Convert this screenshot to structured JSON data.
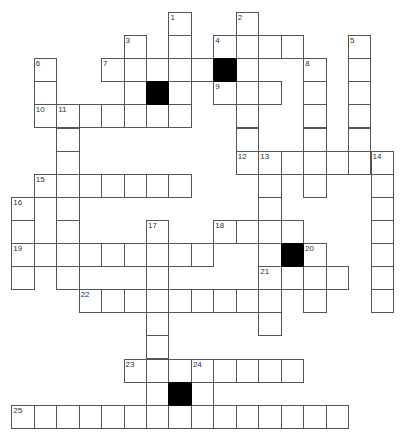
{
  "puzzle": {
    "type": "crossword",
    "grid": {
      "origin_x": 11.3,
      "origin_y": 12,
      "cell_w": 22.45,
      "cell_h": 23.1
    },
    "entries": [
      {
        "number": "1",
        "direction": "down",
        "row": 0,
        "col": 7,
        "length": 5
      },
      {
        "number": "2",
        "direction": "down",
        "row": 0,
        "col": 10,
        "length": 7
      },
      {
        "number": "3",
        "direction": "down",
        "row": 1,
        "col": 5,
        "length": 4
      },
      {
        "number": "4",
        "direction": "across",
        "row": 1,
        "col": 9,
        "length": 4
      },
      {
        "number": "5",
        "direction": "down",
        "row": 1,
        "col": 15,
        "length": 6
      },
      {
        "number": "6",
        "direction": "down",
        "row": 2,
        "col": 1,
        "length": 3
      },
      {
        "number": "7",
        "direction": "across",
        "row": 2,
        "col": 4,
        "length": 5
      },
      {
        "number": "8",
        "direction": "down",
        "row": 2,
        "col": 13,
        "length": 6
      },
      {
        "number": "9",
        "direction": "across",
        "row": 3,
        "col": 9,
        "length": 3
      },
      {
        "number": "10",
        "direction": "across",
        "row": 4,
        "col": 1,
        "length": 7
      },
      {
        "number": "11",
        "direction": "down",
        "row": 4,
        "col": 2,
        "length": 8
      },
      {
        "number": "12",
        "direction": "across",
        "row": 6,
        "col": 10,
        "length": 7
      },
      {
        "number": "13",
        "direction": "down",
        "row": 6,
        "col": 11,
        "length": 8
      },
      {
        "number": "14",
        "direction": "down",
        "row": 6,
        "col": 16,
        "length": 7
      },
      {
        "number": "15",
        "direction": "across",
        "row": 7,
        "col": 1,
        "length": 7
      },
      {
        "number": "16",
        "direction": "down",
        "row": 8,
        "col": 0,
        "length": 4
      },
      {
        "number": "17",
        "direction": "down",
        "row": 9,
        "col": 6,
        "length": 9
      },
      {
        "number": "18",
        "direction": "across",
        "row": 9,
        "col": 9,
        "length": 4
      },
      {
        "number": "19",
        "direction": "across",
        "row": 10,
        "col": 0,
        "length": 9
      },
      {
        "number": "20",
        "direction": "down",
        "row": 10,
        "col": 13,
        "length": 3
      },
      {
        "number": "21",
        "direction": "across",
        "row": 11,
        "col": 11,
        "length": 4
      },
      {
        "number": "22",
        "direction": "across",
        "row": 12,
        "col": 3,
        "length": 9
      },
      {
        "number": "23",
        "direction": "across",
        "row": 15,
        "col": 5,
        "length": 8
      },
      {
        "number": "24",
        "direction": "down",
        "row": 15,
        "col": 8,
        "length": 3
      },
      {
        "number": "25",
        "direction": "across",
        "row": 17,
        "col": 0,
        "length": 15
      }
    ],
    "black_cells": [
      {
        "row": 2,
        "col": 9
      },
      {
        "row": 3,
        "col": 6
      },
      {
        "row": 10,
        "col": 12
      },
      {
        "row": 16,
        "col": 7
      }
    ]
  }
}
